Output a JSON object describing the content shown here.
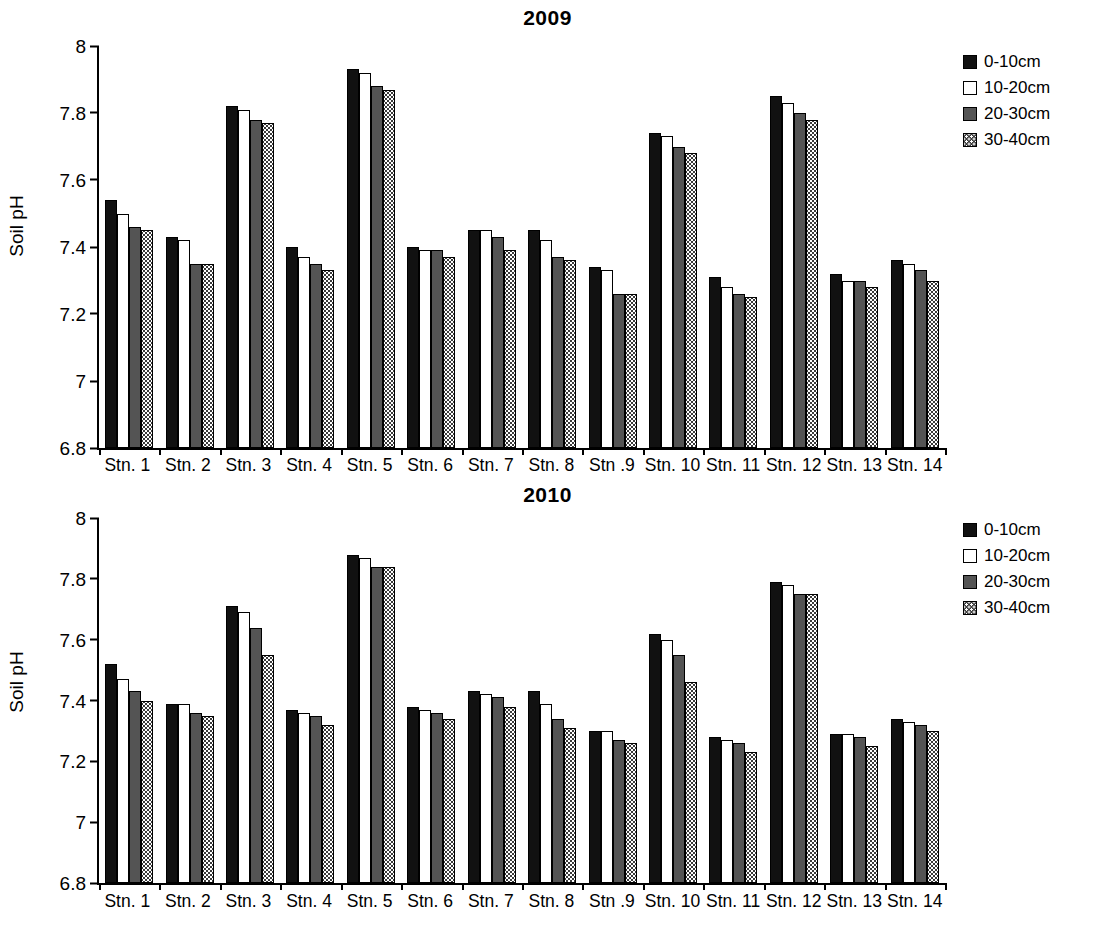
{
  "chart_data": [
    {
      "type": "bar",
      "title": "2009",
      "xlabel": "",
      "ylabel": "Soil pH",
      "ylim": [
        6.8,
        8
      ],
      "yticks": [
        "8",
        "7.8",
        "7.6",
        "7.4",
        "7.2",
        "7",
        "6.8"
      ],
      "grid": false,
      "legend_position": "top-right",
      "categories": [
        "Stn. 1",
        "Stn. 2",
        "Stn. 3",
        "Stn. 4",
        "Stn. 5",
        "Stn. 6",
        "Stn. 7",
        "Stn. 8",
        "Stn .9",
        "Stn. 10",
        "Stn. 11",
        "Stn. 12",
        "Stn. 13",
        "Stn. 14"
      ],
      "series": [
        {
          "name": "0-10cm",
          "values": [
            7.54,
            7.43,
            7.82,
            7.4,
            7.93,
            7.4,
            7.45,
            7.45,
            7.34,
            7.74,
            7.31,
            7.85,
            7.32,
            7.36
          ]
        },
        {
          "name": "10-20cm",
          "values": [
            7.5,
            7.42,
            7.81,
            7.37,
            7.92,
            7.39,
            7.45,
            7.42,
            7.33,
            7.73,
            7.28,
            7.83,
            7.3,
            7.35
          ]
        },
        {
          "name": "20-30cm",
          "values": [
            7.46,
            7.35,
            7.78,
            7.35,
            7.88,
            7.39,
            7.43,
            7.37,
            7.26,
            7.7,
            7.26,
            7.8,
            7.3,
            7.33
          ]
        },
        {
          "name": "30-40cm",
          "values": [
            7.45,
            7.35,
            7.77,
            7.33,
            7.87,
            7.37,
            7.39,
            7.36,
            7.26,
            7.68,
            7.25,
            7.78,
            7.28,
            7.3
          ]
        }
      ]
    },
    {
      "type": "bar",
      "title": "2010",
      "xlabel": "",
      "ylabel": "Soil pH",
      "ylim": [
        6.8,
        8
      ],
      "yticks": [
        "8",
        "7.8",
        "7.6",
        "7.4",
        "7.2",
        "7",
        "6.8"
      ],
      "grid": false,
      "legend_position": "top-right",
      "categories": [
        "Stn. 1",
        "Stn. 2",
        "Stn. 3",
        "Stn. 4",
        "Stn. 5",
        "Stn. 6",
        "Stn. 7",
        "Stn. 8",
        "Stn .9",
        "Stn. 10",
        "Stn. 11",
        "Stn. 12",
        "Stn. 13",
        "Stn. 14"
      ],
      "series": [
        {
          "name": "0-10cm",
          "values": [
            7.52,
            7.39,
            7.71,
            7.37,
            7.88,
            7.38,
            7.43,
            7.43,
            7.3,
            7.62,
            7.28,
            7.79,
            7.29,
            7.34
          ]
        },
        {
          "name": "10-20cm",
          "values": [
            7.47,
            7.39,
            7.69,
            7.36,
            7.87,
            7.37,
            7.42,
            7.39,
            7.3,
            7.6,
            7.27,
            7.78,
            7.29,
            7.33
          ]
        },
        {
          "name": "20-30cm",
          "values": [
            7.43,
            7.36,
            7.64,
            7.35,
            7.84,
            7.36,
            7.41,
            7.34,
            7.27,
            7.55,
            7.26,
            7.75,
            7.28,
            7.32
          ]
        },
        {
          "name": "30-40cm",
          "values": [
            7.4,
            7.35,
            7.55,
            7.32,
            7.84,
            7.34,
            7.38,
            7.31,
            7.26,
            7.46,
            7.23,
            7.75,
            7.25,
            7.3
          ]
        }
      ]
    }
  ],
  "panels": [
    {
      "title": "2009",
      "ylabel": "Soil pH",
      "legend": [
        {
          "label": "0-10cm"
        },
        {
          "label": "10-20cm"
        },
        {
          "label": "20-30cm"
        },
        {
          "label": "30-40cm"
        }
      ]
    },
    {
      "title": "2010",
      "ylabel": "Soil pH",
      "legend": [
        {
          "label": "0-10cm"
        },
        {
          "label": "10-20cm"
        },
        {
          "label": "20-30cm"
        },
        {
          "label": "30-40cm"
        }
      ]
    }
  ],
  "colors": {
    "series_0_10cm": "#111111",
    "series_10_20cm": "#ffffff",
    "series_20_30cm": "#545454",
    "series_30_40cm": "#3a3a3a",
    "axis": "#000000",
    "background": "#ffffff"
  }
}
